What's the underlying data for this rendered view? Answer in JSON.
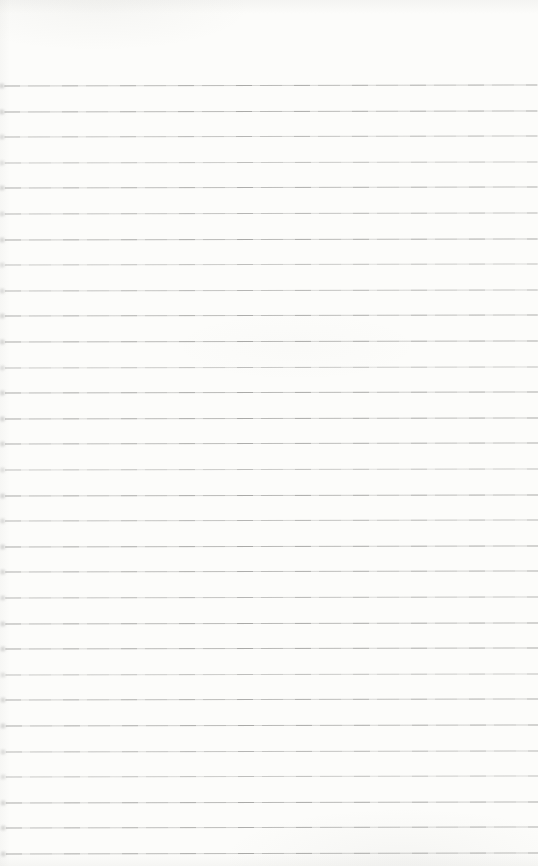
{
  "document": {
    "kind": "blank-ruled-notebook-page",
    "visible_text": "",
    "page_width_px": 538,
    "page_height_px": 866,
    "paper_color": "#fcfcfa",
    "rule_color": "#969694",
    "rule_count": 31,
    "first_rule_y_px": 85,
    "rule_spacing_px": 25.6,
    "rule_left_inset_px": 5,
    "rule_right_inset_px": 0,
    "tilt_degrees": -0.1
  }
}
